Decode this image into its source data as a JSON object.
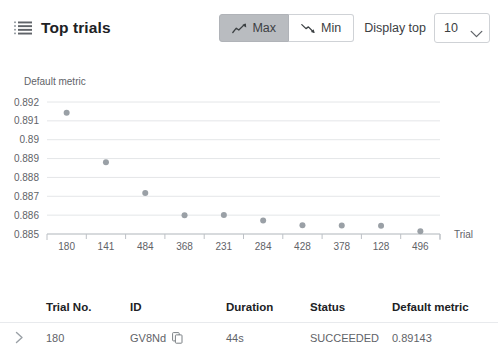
{
  "header": {
    "title": "Top trials",
    "list_icon": "list-icon",
    "max_label": "Max",
    "min_label": "Min",
    "max_selected": true,
    "min_selected": false,
    "max_icon": "trend-up-icon",
    "min_icon": "trend-down-icon",
    "display_top_label": "Display top",
    "display_top_value": "10",
    "display_top_options": [
      "10"
    ],
    "chevron_icon": "chevron-down-icon"
  },
  "colors": {
    "point": "#9aa0a6",
    "gridline": "#e4e6e8",
    "axis": "#bdc1c6",
    "selected_button_bg": "#b9bcc0",
    "text_primary": "#202124",
    "text_secondary": "#5f6368"
  },
  "chart_data": {
    "type": "scatter",
    "title": "",
    "ylabel": "Default metric",
    "xlabel": "Trial",
    "categories": [
      "180",
      "141",
      "484",
      "368",
      "231",
      "284",
      "428",
      "378",
      "128",
      "496"
    ],
    "values": [
      0.89143,
      0.8888,
      0.88718,
      0.886,
      0.88601,
      0.88571,
      0.88546,
      0.88545,
      0.88544,
      0.88515
    ],
    "ytick_labels": [
      "0.892",
      "0.891",
      "0.89",
      "0.889",
      "0.888",
      "0.887",
      "0.886",
      "0.885"
    ],
    "ylim": [
      0.885,
      0.892
    ],
    "grid": true,
    "legend": "none"
  },
  "table": {
    "columns": [
      "Trial No.",
      "ID",
      "Duration",
      "Status",
      "Default metric"
    ],
    "expand_icon": "chevron-right-icon",
    "copy_icon": "copy-icon",
    "rows": [
      {
        "trial_no": "180",
        "id": "GV8Nd",
        "duration": "44s",
        "status": "SUCCEEDED",
        "default_metric": "0.89143"
      }
    ]
  }
}
